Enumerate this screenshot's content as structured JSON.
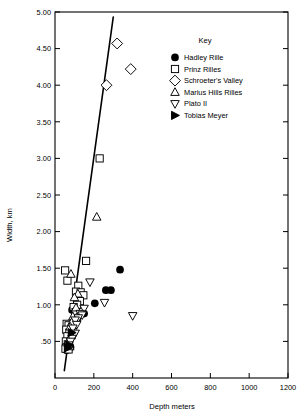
{
  "chart_data": {
    "type": "scatter",
    "title": "",
    "xlabel": "Depth meters",
    "ylabel": "Width, km",
    "xlim": [
      0,
      1200
    ],
    "ylim": [
      0,
      5.0
    ],
    "grid": false,
    "xticks": [
      0,
      200,
      400,
      600,
      800,
      1000,
      1200
    ],
    "xtick_labels": [
      "0",
      "200",
      "400",
      "600",
      "800",
      "1000",
      "1200"
    ],
    "yticks": [
      0.5,
      1.0,
      1.5,
      2.0,
      2.5,
      3.0,
      3.5,
      4.0,
      4.5,
      5.0
    ],
    "ytick_labels": [
      ".50",
      "1.00",
      "1.50",
      "2.00",
      "2.50",
      "3.00",
      "3.50",
      "4.00",
      "4.50",
      "5.00"
    ],
    "legend_position": "upper right",
    "legend_title": "Key",
    "series": [
      {
        "name": "Hadley Rille",
        "marker": "filled-circle",
        "color": "#000000",
        "points": [
          [
            335,
            1.48
          ],
          [
            262,
            1.2
          ],
          [
            288,
            1.2
          ],
          [
            205,
            1.02
          ],
          [
            88,
            0.93
          ],
          [
            150,
            0.88
          ],
          [
            96,
            0.61
          ],
          [
            72,
            0.44
          ],
          [
            80,
            0.42
          ],
          [
            66,
            0.4
          ],
          [
            60,
            0.38
          ]
        ]
      },
      {
        "name": "Prinz Rilles",
        "marker": "open-square",
        "color": "#000000",
        "points": [
          [
            230,
            3.0
          ],
          [
            160,
            1.6
          ],
          [
            52,
            1.47
          ],
          [
            64,
            1.33
          ],
          [
            120,
            1.26
          ],
          [
            108,
            1.18
          ],
          [
            132,
            1.17
          ],
          [
            146,
            1.13
          ],
          [
            128,
            1.05
          ],
          [
            114,
            1.0
          ],
          [
            96,
            0.97
          ],
          [
            106,
            0.9
          ],
          [
            60,
            0.74
          ],
          [
            70,
            0.72
          ],
          [
            58,
            0.66
          ],
          [
            74,
            0.62
          ],
          [
            64,
            0.57
          ],
          [
            56,
            0.5
          ],
          [
            66,
            0.46
          ],
          [
            60,
            0.42
          ],
          [
            54,
            0.4
          ],
          [
            70,
            0.39
          ]
        ]
      },
      {
        "name": "Schroeter's Valley",
        "marker": "open-diamond",
        "color": "#000000",
        "points": [
          [
            320,
            4.57
          ],
          [
            390,
            4.22
          ],
          [
            265,
            4.0
          ]
        ]
      },
      {
        "name": "Marius Hills Rilles",
        "marker": "open-triangle-up",
        "color": "#000000",
        "points": [
          [
            215,
            2.2
          ],
          [
            82,
            1.42
          ],
          [
            118,
            1.15
          ],
          [
            100,
            1.1
          ],
          [
            108,
            0.96
          ],
          [
            92,
            0.84
          ],
          [
            112,
            0.83
          ],
          [
            86,
            0.76
          ],
          [
            78,
            0.7
          ],
          [
            96,
            0.66
          ],
          [
            84,
            0.58
          ],
          [
            72,
            0.52
          ],
          [
            68,
            0.47
          ],
          [
            76,
            0.43
          ]
        ]
      },
      {
        "name": "Plato II",
        "marker": "open-triangle-down",
        "color": "#000000",
        "points": [
          [
            400,
            0.85
          ],
          [
            180,
            1.31
          ],
          [
            255,
            1.03
          ],
          [
            150,
            0.95
          ],
          [
            130,
            0.88
          ],
          [
            140,
            0.86
          ],
          [
            120,
            0.82
          ],
          [
            104,
            0.79
          ],
          [
            112,
            0.73
          ],
          [
            92,
            0.68
          ],
          [
            104,
            0.61
          ],
          [
            88,
            0.54
          ],
          [
            80,
            0.5
          ],
          [
            70,
            0.45
          ]
        ]
      },
      {
        "name": "Tobias Meyer",
        "marker": "filled-triangle-right",
        "color": "#000000",
        "points": [
          [
            86,
            0.62
          ],
          [
            74,
            0.45
          ],
          [
            66,
            0.41
          ]
        ]
      }
    ],
    "fit_line": {
      "name": "regression-line",
      "x": [
        48,
        300
      ],
      "y": [
        0.1,
        4.93
      ]
    }
  },
  "legend": {
    "title": "Key",
    "entries": [
      {
        "label": "Hadley Rille",
        "marker": "filled-circle"
      },
      {
        "label": "Prinz Rilles",
        "marker": "open-square"
      },
      {
        "label": "Schroeter's Valley",
        "marker": "open-diamond"
      },
      {
        "label": "Marius Hills Rilles",
        "marker": "open-triangle-up"
      },
      {
        "label": "Plato II",
        "marker": "open-triangle-down"
      },
      {
        "label": "Tobias Meyer",
        "marker": "filled-triangle-right"
      }
    ]
  }
}
